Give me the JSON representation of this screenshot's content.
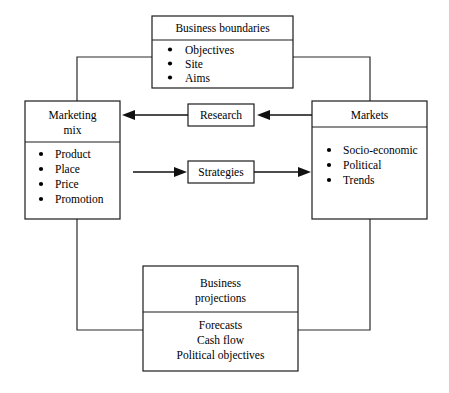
{
  "diagram": {
    "background_color": "#ffffff",
    "line_color": "#1c1c1c",
    "text_color": "#000000"
  },
  "boxes": {
    "business_boundaries": {
      "title": "Business boundaries",
      "items": [
        "Objectives",
        "Site",
        "Aims"
      ],
      "bulleted": true
    },
    "marketing_mix": {
      "title_line1": "Marketing",
      "title_line2": "mix",
      "items": [
        "Product",
        "Place",
        "Price",
        "Promotion"
      ],
      "bulleted": true
    },
    "markets": {
      "title": "Markets",
      "items": [
        "Socio-economic",
        "Political",
        "Trends"
      ],
      "bulleted": true
    },
    "business_projections": {
      "title_line1": "Business",
      "title_line2": "projections",
      "items": [
        "Forecasts",
        "Cash flow",
        "Political objectives"
      ],
      "bulleted": false
    }
  },
  "nodes": {
    "research": {
      "label": "Research"
    },
    "strategies": {
      "label": "Strategies"
    }
  },
  "flows": [
    {
      "from": "research",
      "to": "marketing_mix",
      "direction": "left"
    },
    {
      "from": "markets",
      "to": "research",
      "direction": "left"
    },
    {
      "from": "marketing_mix",
      "to": "strategies",
      "direction": "right"
    },
    {
      "from": "strategies",
      "to": "markets",
      "direction": "right"
    }
  ]
}
